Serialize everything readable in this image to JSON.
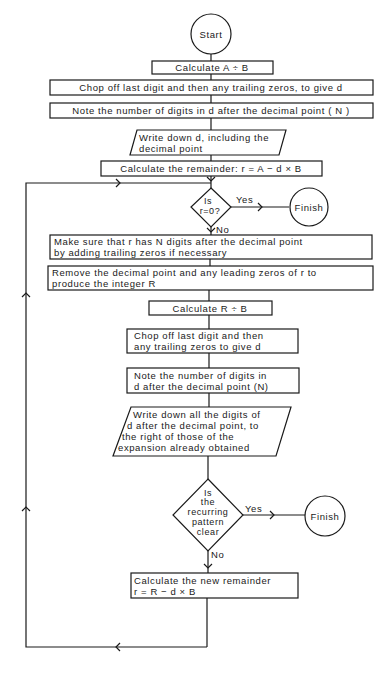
{
  "flowchart": {
    "start": "Start",
    "steps": {
      "calc_ab": "Calculate  A ÷ B",
      "chop1": "Chop off last digit and then any trailing zeros, to give d",
      "note1": "Note the number of digits in d after the decimal point ( N )",
      "write1": [
        "Write down d, including the",
        "decimal point"
      ],
      "rem1": "Calculate the remainder: r = A − d × B",
      "decision1": [
        "Is",
        "r=0?"
      ],
      "make_sure": [
        "Make sure that r has N digits after the decimal point",
        "by adding trailing zeros if necessary"
      ],
      "remove": [
        "Remove the decimal point and any leading zeros of r to",
        "produce the integer R"
      ],
      "calc_rb": "Calculate  R ÷ B",
      "chop2": [
        "Chop off last digit and then",
        "any trailing zeros to give d"
      ],
      "note2": [
        "Note the number of digits in",
        "d after the decimal point (N)"
      ],
      "write2": [
        "Write down all the digits of",
        "d after the decimal point, to",
        "the right of those of the",
        "expansion already obtained"
      ],
      "decision2": [
        "Is",
        "the",
        "recurring",
        "pattern",
        "clear"
      ],
      "new_rem": [
        "Calculate the new remainder",
        "r = R − d × B"
      ]
    },
    "finish_1": "Finish",
    "finish_2": "Finish",
    "yes_label": "Yes",
    "no_label": "No"
  }
}
